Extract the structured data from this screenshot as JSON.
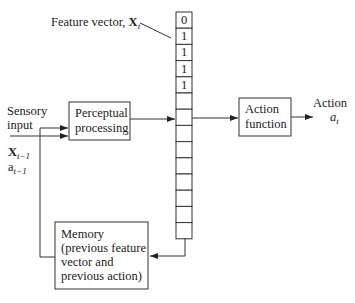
{
  "feature_vector": {
    "label": "Feature vector, ",
    "symbol": "X",
    "subscript": "t",
    "values": [
      "0",
      "1",
      "1",
      "1",
      "1",
      "",
      "",
      "",
      "",
      "",
      "",
      "",
      "",
      ""
    ]
  },
  "sensory_input": {
    "line1": "Sensory",
    "line2": "input"
  },
  "prev_inputs": {
    "x_symbol": "X",
    "x_sub": "t−1",
    "a_symbol": "a",
    "a_sub": "t−1"
  },
  "perceptual_box": {
    "line1": "Perceptual",
    "line2": "processing"
  },
  "action_box": {
    "line1": "Action",
    "line2": "function"
  },
  "action_output": {
    "label": "Action",
    "symbol": "a",
    "sub": "t"
  },
  "memory_box": {
    "line1": "Memory",
    "line2": "(previous feature",
    "line3": "vector and",
    "line4": "previous action)"
  }
}
